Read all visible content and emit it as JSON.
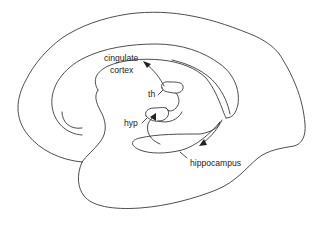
{
  "diagram": {
    "labels": {
      "cingulate_line1": "cingulate",
      "cingulate_line2": "cortex",
      "thalamus": "th",
      "hypothalamus": "hyp",
      "hippocampus": "hippocampus"
    },
    "colors": {
      "line": "#3a3a3a",
      "text": "#222222",
      "background": "#ffffff"
    }
  }
}
